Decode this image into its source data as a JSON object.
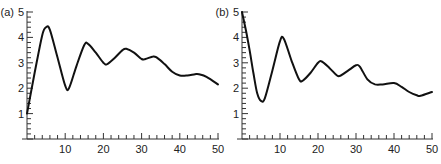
{
  "chart_data": [
    {
      "type": "line",
      "panel_label": "(a)",
      "title": "",
      "xlabel": "",
      "ylabel": "",
      "xlim": [
        0,
        50
      ],
      "ylim": [
        0,
        5
      ],
      "x_ticks": [
        10,
        20,
        30,
        40,
        50
      ],
      "y_ticks": [
        1,
        2,
        3,
        4,
        5
      ],
      "grid": false,
      "legend": null,
      "series": [
        {
          "name": "curve-a",
          "x": [
            0,
            2,
            4,
            5,
            6,
            8,
            10,
            11,
            13,
            15,
            16,
            18,
            20,
            21,
            23,
            25,
            26,
            28,
            30,
            31,
            33,
            34,
            36,
            38,
            40,
            42,
            44,
            45,
            47,
            50
          ],
          "y": [
            1.0,
            2.6,
            4.1,
            4.4,
            4.3,
            3.2,
            2.1,
            2.0,
            2.9,
            3.7,
            3.75,
            3.4,
            3.0,
            2.95,
            3.2,
            3.5,
            3.55,
            3.4,
            3.15,
            3.15,
            3.25,
            3.2,
            2.95,
            2.65,
            2.5,
            2.5,
            2.55,
            2.55,
            2.45,
            2.15
          ]
        }
      ]
    },
    {
      "type": "line",
      "panel_label": "(b)",
      "title": "",
      "xlabel": "",
      "ylabel": "",
      "xlim": [
        0,
        50
      ],
      "ylim": [
        0,
        5
      ],
      "x_ticks": [
        10,
        20,
        30,
        40,
        50
      ],
      "y_ticks": [
        1,
        2,
        3,
        4,
        5
      ],
      "grid": false,
      "legend": null,
      "series": [
        {
          "name": "curve-b",
          "x": [
            0,
            1,
            2,
            3,
            4,
            5,
            6,
            8,
            10,
            11,
            13,
            15,
            16,
            18,
            20,
            21,
            23,
            25,
            26,
            28,
            30,
            31,
            33,
            35,
            37,
            40,
            42,
            44,
            46,
            47,
            50
          ],
          "y": [
            5.0,
            4.3,
            3.5,
            2.6,
            1.8,
            1.5,
            1.6,
            2.7,
            3.85,
            3.95,
            3.1,
            2.35,
            2.3,
            2.6,
            3.0,
            3.05,
            2.8,
            2.5,
            2.5,
            2.7,
            2.9,
            2.85,
            2.35,
            2.15,
            2.15,
            2.2,
            2.05,
            1.85,
            1.72,
            1.7,
            1.85
          ]
        }
      ]
    }
  ],
  "panels": [
    {
      "label": "(a)",
      "y_tick_labels": [
        "1",
        "2",
        "3",
        "4",
        "5"
      ],
      "x_tick_labels": [
        "10",
        "20",
        "30",
        "40",
        "50"
      ]
    },
    {
      "label": "(b)",
      "y_tick_labels": [
        "1",
        "2",
        "3",
        "4",
        "5"
      ],
      "x_tick_labels": [
        "10",
        "20",
        "30",
        "40",
        "50"
      ]
    }
  ]
}
